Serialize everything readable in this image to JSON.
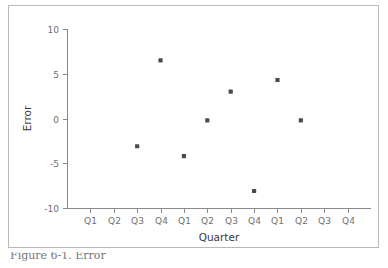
{
  "figure": {
    "caption": "Figure 6-1. Error",
    "border_color": "#b9b9b9",
    "background_color": "#ffffff"
  },
  "chart_data": {
    "type": "scatter",
    "title": "",
    "xlabel": "Quarter",
    "ylabel": "Error",
    "categories": [
      "Q1",
      "Q2",
      "Q3",
      "Q4",
      "Q1",
      "Q2",
      "Q3",
      "Q4",
      "Q1",
      "Q2",
      "Q3",
      "Q4"
    ],
    "ytick_labels": [
      "10",
      "5",
      "0",
      "-5",
      "-10"
    ],
    "ytick_values": [
      10,
      5,
      0,
      -5,
      -10
    ],
    "ylim": [
      -10,
      10
    ],
    "xlim": [
      0.5,
      12.5
    ],
    "grid": false,
    "legend": null,
    "marker_color": "#4a4a52",
    "axis_color": "#8a8a8a",
    "points": [
      {
        "x": 3,
        "category": "Q3",
        "y": -3.1
      },
      {
        "x": 4,
        "category": "Q4",
        "y": 6.5
      },
      {
        "x": 5,
        "category": "Q1",
        "y": -4.2
      },
      {
        "x": 6,
        "category": "Q2",
        "y": -0.2
      },
      {
        "x": 7,
        "category": "Q3",
        "y": 3.0
      },
      {
        "x": 8,
        "category": "Q4",
        "y": -8.1
      },
      {
        "x": 9,
        "category": "Q1",
        "y": 4.3
      },
      {
        "x": 10,
        "category": "Q2",
        "y": -0.2
      }
    ]
  }
}
